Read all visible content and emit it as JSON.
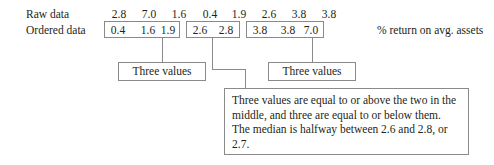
{
  "figure": {
    "rows": {
      "raw": {
        "label": "Raw data",
        "values": [
          "2.8",
          "7.0",
          "1.6",
          "0.4",
          "1.9",
          "2.6",
          "3.8",
          "3.8"
        ]
      },
      "ordered": {
        "label": "Ordered data",
        "values": [
          "0.4",
          "1.6",
          "1.9",
          "2.6",
          "2.8",
          "3.8",
          "3.8",
          "7.0"
        ]
      }
    },
    "units_note": "% return on avg. assets",
    "groups": [
      {
        "name": "lower",
        "values": [
          "0.4",
          "1.6",
          "1.9"
        ]
      },
      {
        "name": "middle",
        "values": [
          "2.6",
          "2.8"
        ]
      },
      {
        "name": "upper",
        "values": [
          "3.8",
          "3.8",
          "7.0"
        ]
      }
    ],
    "callouts": {
      "left": "Three values",
      "right": "Three values"
    },
    "explanation": "Three values are equal to or above the two in the middle, and three are equal to or below them. The median is halfway between 2.6 and 2.8, or 2.7.",
    "colors": {
      "text": "#231f20",
      "rule": "#8a8a8a",
      "background": "#ffffff"
    }
  }
}
